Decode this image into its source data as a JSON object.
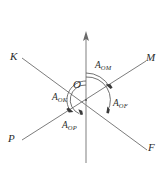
{
  "figure": {
    "background_color": "#ffffff",
    "line_color": "#6d6d6d",
    "arc_color": "#5a5a5a",
    "label_color": "#2b2b2b",
    "vertex": {
      "label": "O",
      "x": 86,
      "y": 100
    },
    "axis": {
      "name": "vertical-axis",
      "label": "",
      "x": 86,
      "top_y": 32,
      "bottom_y": 163,
      "has_arrow_up": true
    },
    "rays": [
      {
        "id": "K",
        "label": "K",
        "end_x": 22,
        "end_y": 58,
        "label_x": 10,
        "label_y": 51
      },
      {
        "id": "M",
        "label": "M",
        "end_x": 146,
        "end_y": 61,
        "label_x": 148,
        "label_y": 52
      },
      {
        "id": "P",
        "label": "P",
        "end_x": 22,
        "end_y": 140,
        "label_x": 8,
        "label_y": 133
      },
      {
        "id": "F",
        "label": "F",
        "end_x": 147,
        "end_y": 150,
        "label_x": 148,
        "label_y": 142
      }
    ],
    "angles": [
      {
        "id": "A_OM",
        "base": "A",
        "subscript": "OM",
        "display": "A",
        "label_x": 95,
        "label_y": 61,
        "arc_radius": 27,
        "start_deg": 90,
        "end_deg": 28
      },
      {
        "id": "A_OF",
        "base": "A",
        "subscript": "OF",
        "display": "A",
        "label_x": 113,
        "label_y": 99,
        "arc_radius": 23,
        "start_deg": 90,
        "end_deg": -22
      },
      {
        "id": "A_OK",
        "base": "A",
        "subscript": "OK",
        "display": "A",
        "label_x": 52,
        "label_y": 93,
        "arc_radius": 19,
        "start_deg": 90,
        "end_deg": 152
      },
      {
        "id": "A_OP",
        "base": "A",
        "subscript": "OP",
        "display": "A",
        "label_x": 62,
        "label_y": 121,
        "arc_radius": 15,
        "start_deg": 90,
        "end_deg": 208
      }
    ]
  }
}
